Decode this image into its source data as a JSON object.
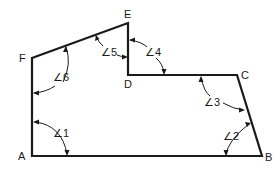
{
  "diagram": {
    "type": "polygon-angles",
    "vertices": [
      {
        "id": "A",
        "label": "A",
        "x": 32,
        "y": 156
      },
      {
        "id": "B",
        "label": "B",
        "x": 262,
        "y": 156
      },
      {
        "id": "C",
        "label": "C",
        "x": 237,
        "y": 75
      },
      {
        "id": "D",
        "label": "D",
        "x": 128,
        "y": 75
      },
      {
        "id": "E",
        "label": "E",
        "x": 128,
        "y": 23
      },
      {
        "id": "F",
        "label": "F",
        "x": 32,
        "y": 58
      }
    ],
    "edges": [
      [
        "A",
        "B"
      ],
      [
        "B",
        "C"
      ],
      [
        "C",
        "D"
      ],
      [
        "D",
        "E"
      ],
      [
        "E",
        "F"
      ],
      [
        "F",
        "A"
      ]
    ],
    "angles": [
      {
        "id": "1",
        "label": "∠1",
        "vertex": "A"
      },
      {
        "id": "2",
        "label": "∠2",
        "vertex": "B"
      },
      {
        "id": "3",
        "label": "∠3",
        "vertex": "C"
      },
      {
        "id": "4",
        "label": "∠4",
        "vertex": "D"
      },
      {
        "id": "5",
        "label": "∠5",
        "vertex": "E"
      },
      {
        "id": "6",
        "label": "∠6",
        "vertex": "F"
      }
    ],
    "colors": {
      "stroke": "#1a1a1a",
      "background": "#ffffff"
    }
  }
}
